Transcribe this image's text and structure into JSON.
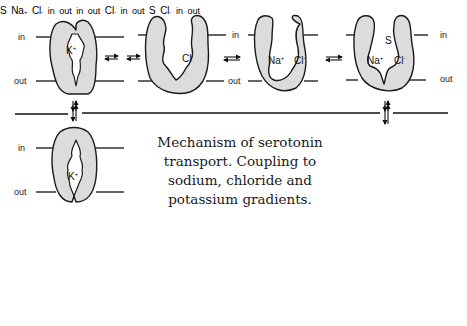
{
  "figure": {
    "caption_lines": [
      "Mechanism of serotonin",
      "transport.  Coupling to",
      "sodium, chloride and",
      "potassium gradients."
    ],
    "membrane_labels": {
      "inside": "in",
      "outside": "out"
    },
    "ions": {
      "potassium": "K",
      "potassium_charge": "+",
      "sodium": "Na",
      "sodium_charge": "+",
      "chloride": "Cl",
      "chloride_charge": "-",
      "substrate": "S"
    },
    "states": [
      {
        "id": "top-1",
        "row": "top",
        "bound": [
          "K+"
        ],
        "orientation": "occluded"
      },
      {
        "id": "top-2",
        "row": "top",
        "bound": [
          "Cl-"
        ],
        "orientation": "outward-open"
      },
      {
        "id": "top-3",
        "row": "top",
        "bound": [
          "Na+",
          "Cl-"
        ],
        "orientation": "outward-open"
      },
      {
        "id": "top-4",
        "row": "top",
        "bound": [
          "S",
          "Na+",
          "Cl-"
        ],
        "orientation": "outward-open"
      },
      {
        "id": "mid-left",
        "row": "middle",
        "bound": [
          "K+"
        ],
        "orientation": "occluded"
      },
      {
        "id": "mid-right",
        "row": "middle",
        "bound": [
          "S",
          "Na+",
          "Cl-"
        ],
        "orientation": "occluded"
      },
      {
        "id": "bottom-1",
        "row": "bottom",
        "bound": [],
        "orientation": "inward-open"
      },
      {
        "id": "bottom-2",
        "row": "bottom",
        "bound": [
          "Cl-"
        ],
        "orientation": "inward-open"
      },
      {
        "id": "bottom-3",
        "row": "bottom",
        "bound": [
          "S",
          "Cl-"
        ],
        "orientation": "inward-open"
      }
    ],
    "colors": {
      "protein_fill": "#dcdcdc",
      "outline": "#1a1a1a",
      "background": "#ffffff"
    }
  }
}
